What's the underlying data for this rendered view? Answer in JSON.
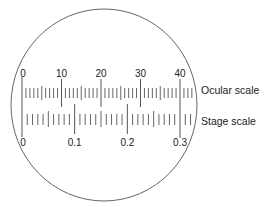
{
  "diagram": {
    "ocular_scale": {
      "label": "Ocular scale",
      "min": 0,
      "max": 40,
      "minor_step": 1,
      "medium_step": 5,
      "major_step": 10,
      "tick_labels": [
        "0",
        "10",
        "20",
        "30",
        "40"
      ],
      "extra_ticks_beyond_max": 3
    },
    "stage_scale": {
      "label": "Stage scale",
      "min": 0,
      "max": 0.3,
      "minor_step": 0.01,
      "medium_step": 0.05,
      "major_step": 0.1,
      "tick_labels": [
        "0",
        "0.1",
        "0.2",
        "0.3"
      ],
      "extra_ticks_beyond_max": 2
    },
    "alignment": "Ocular 0 aligns with stage 0; ocular 40 aligns with stage 0.3",
    "colors": {
      "line": "#555555",
      "text": "#222222",
      "circle": "#666666"
    }
  }
}
